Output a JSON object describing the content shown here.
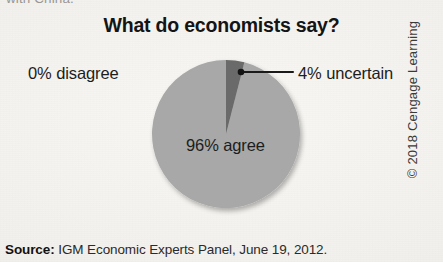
{
  "page": {
    "cutoff_top_text": "with China.",
    "credit": "© 2018 Cengage Learning"
  },
  "source_note": {
    "label": "Source:",
    "text": " IGM Economic Experts Panel, June 19, 2012."
  },
  "colors": {
    "background": "#f4f2ef",
    "slice_agree": "#a8a8a8",
    "slice_uncertain": "#6b6b6b",
    "text": "#1c1c1c",
    "leader_line": "#1a1a1a"
  },
  "chart_data": {
    "type": "pie",
    "title": "What do economists say?",
    "xlabel": "",
    "ylabel": "",
    "legend_position": "none",
    "grid": false,
    "categories": [
      "96% agree",
      "4% uncertain",
      "0% disagree"
    ],
    "values": [
      96,
      4,
      0
    ],
    "labels": [
      {
        "name": "agree",
        "text": "96% agree",
        "value": 96,
        "color": "#a8a8a8",
        "placement": "inside"
      },
      {
        "name": "uncertain",
        "text": "4% uncertain",
        "value": 4,
        "color": "#6b6b6b",
        "placement": "outside-right-with-leader"
      },
      {
        "name": "disagree",
        "text": "0% disagree",
        "value": 0,
        "color": "#a8a8a8",
        "placement": "outside-left"
      }
    ],
    "annotations": [
      {
        "name": "leader-line-uncertain",
        "from": "uncertain-slice",
        "to": "4% uncertain"
      }
    ],
    "geometry": {
      "center_x": 226,
      "center_y": 134,
      "radius": 74,
      "start_angle_deg": 0,
      "uncertain_sweep_deg": 14.4
    },
    "source": "IGM Economic Experts Panel, June 19, 2012."
  }
}
